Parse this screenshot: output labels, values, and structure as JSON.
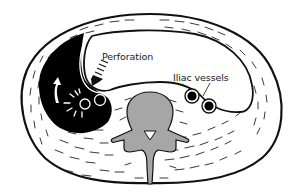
{
  "figure": {
    "type": "anatomical cross-section",
    "colors": {
      "outline": "#111111",
      "muscle_fill": "#ffffff",
      "abscess_fill": "#000000",
      "bone_fill": "#a6a6a6",
      "cavity_fill": "#ffffff"
    }
  },
  "labels": {
    "perforation": "Perforation",
    "iliac_vessels": "Iliac vessels"
  }
}
